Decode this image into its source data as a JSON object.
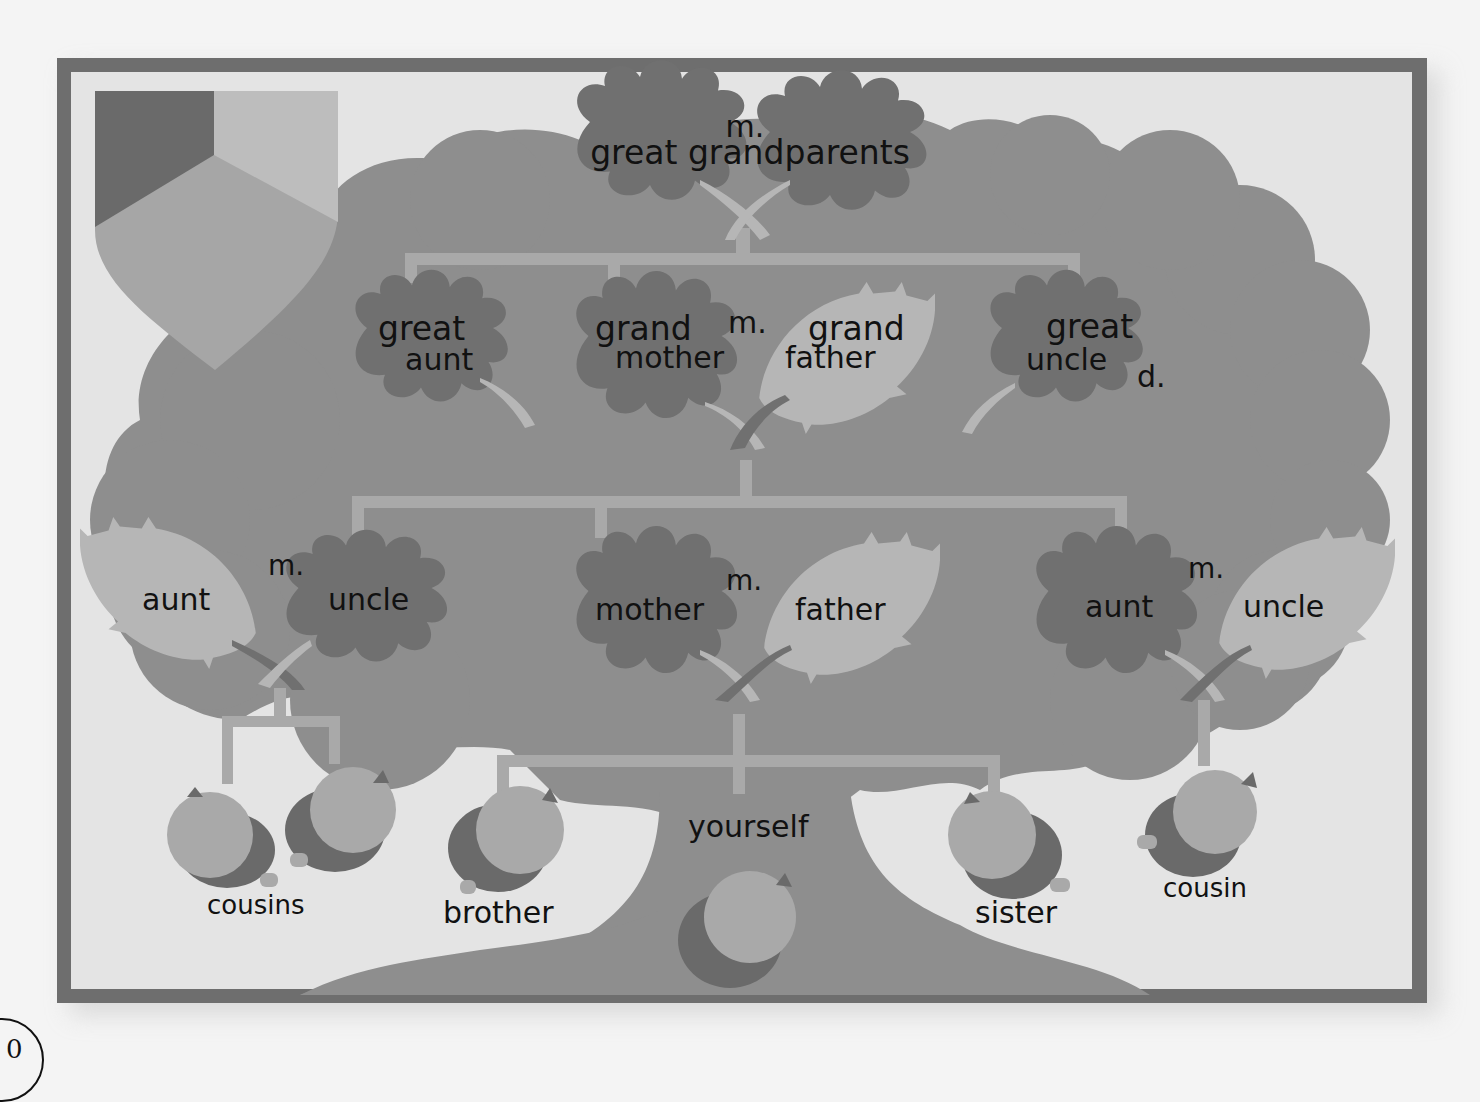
{
  "diagram": {
    "palette": {
      "page_bg": "#f4f4f4",
      "frame": "#6e6e6e",
      "panel_bg": "#e4e4e4",
      "tree": "#8e8e8e",
      "leaf_dark": "#707070",
      "leaf_light": "#b6b6b6",
      "connector": "#a9a9a9",
      "acorn_cap": "#6a6a6a",
      "acorn_nut": "#a9a9a9",
      "text": "#111111"
    },
    "shield": {
      "colors": [
        "#6a6a6a",
        "#bdbdbd",
        "#a6a6a6"
      ]
    },
    "generations": [
      {
        "level": 1,
        "nodes": [
          {
            "id": "great-grandparents",
            "label": "great grandparents",
            "marker": "m."
          }
        ]
      },
      {
        "level": 2,
        "nodes": [
          {
            "id": "great-aunt",
            "label_line1": "great",
            "label_line2": "aunt"
          },
          {
            "id": "grandmother",
            "label_line1": "grand",
            "label_line2": "mother"
          },
          {
            "id": "grandfather",
            "label_line1": "grand",
            "label_line2": "father"
          },
          {
            "id": "great-uncle",
            "label_line1": "great",
            "label_line2": "uncle",
            "status": "d."
          }
        ],
        "marriage_marker": "m."
      },
      {
        "level": 3,
        "nodes": [
          {
            "id": "aunt-left",
            "label": "aunt"
          },
          {
            "id": "uncle-left",
            "label": "uncle"
          },
          {
            "id": "mother",
            "label": "mother"
          },
          {
            "id": "father",
            "label": "father"
          },
          {
            "id": "aunt-right",
            "label": "aunt"
          },
          {
            "id": "uncle-right",
            "label": "uncle"
          }
        ],
        "marriage_markers": [
          "m.",
          "m.",
          "m."
        ]
      },
      {
        "level": 4,
        "nodes": [
          {
            "id": "cousins",
            "label": "cousins"
          },
          {
            "id": "brother",
            "label": "brother"
          },
          {
            "id": "yourself",
            "label": "yourself"
          },
          {
            "id": "sister",
            "label": "sister"
          },
          {
            "id": "cousin",
            "label": "cousin"
          }
        ]
      }
    ],
    "page_number_partial": "0"
  }
}
